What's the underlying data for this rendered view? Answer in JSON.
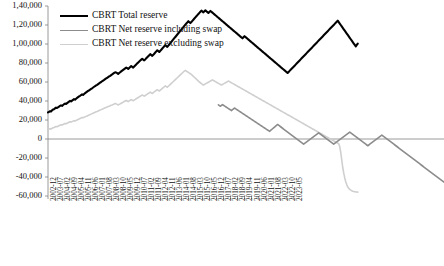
{
  "chart_data": {
    "type": "line",
    "title": "",
    "xlabel": "",
    "ylabel": "",
    "ylim": [
      -60000,
      140000
    ],
    "ytick_values": [
      140000,
      120000,
      100000,
      80000,
      60000,
      40000,
      20000,
      0,
      -20000,
      -40000,
      -60000
    ],
    "ytick_labels": [
      "1,40,000",
      "1,20,000",
      "1,00,000",
      "80,000",
      "60,000",
      "40,000",
      "20,000",
      "0",
      "-20,000",
      "-40,000",
      "-60,000"
    ],
    "grid": false,
    "legend_position": "top-left-inside",
    "x_start": "2002-12",
    "x_end": "2023-05",
    "x_step_months": 1,
    "xtick_step_months": 7,
    "xtick_labels": [
      "2002-12",
      "2003-07",
      "2004-02",
      "2004-09",
      "2005-04",
      "2005-11",
      "2006-06",
      "2007-01",
      "2007-08",
      "2008-03",
      "2008-10",
      "2009-05",
      "2009-12",
      "2010-07",
      "2011-02",
      "2011-09",
      "2012-04",
      "2012-11",
      "2013-06",
      "2014-01",
      "2014-08",
      "2015-03",
      "2015-10",
      "2016-05",
      "2016-12",
      "2017-07",
      "2018-02",
      "2018-09",
      "2019-04",
      "2019-11",
      "2020-06",
      "2021-01",
      "2021-08",
      "2022-03",
      "2022-10",
      "2023-05"
    ],
    "series": [
      {
        "name": "CBRT Total reserve",
        "color": "#000000",
        "width": 2.1,
        "values": [
          28000,
          28600,
          29200,
          28900,
          30100,
          31000,
          31400,
          32200,
          33000,
          32600,
          33400,
          34100,
          34800,
          35400,
          34900,
          35800,
          36600,
          37300,
          36900,
          37800,
          38600,
          39400,
          40100,
          39600,
          40400,
          41200,
          42000,
          41500,
          42400,
          43200,
          44000,
          44800,
          45500,
          46300,
          47000,
          46500,
          47400,
          48200,
          49000,
          49800,
          50600,
          51300,
          52000,
          52700,
          53400,
          54200,
          55000,
          55700,
          56400,
          57000,
          57800,
          58600,
          59300,
          60000,
          60800,
          61500,
          62200,
          63000,
          63700,
          64400,
          65100,
          65800,
          66500,
          67300,
          68000,
          68800,
          69500,
          70200,
          70000,
          69300,
          68500,
          69400,
          70300,
          71200,
          72000,
          72800,
          73600,
          74400,
          75200,
          74500,
          73800,
          74800,
          75800,
          76800,
          76000,
          75200,
          76300,
          77400,
          78500,
          79600,
          80600,
          81600,
          82600,
          83500,
          84400,
          83600,
          82800,
          83800,
          84900,
          86000,
          87100,
          88200,
          89300,
          88400,
          87500,
          88600,
          89800,
          91000,
          92200,
          93400,
          92500,
          91600,
          92800,
          94000,
          95200,
          96400,
          97600,
          98800,
          97900,
          97000,
          98300,
          99600,
          100900,
          102200,
          103500,
          104800,
          106100,
          107400,
          108700,
          110000,
          111300,
          112600,
          113900,
          115200,
          116500,
          117800,
          119100,
          120400,
          121600,
          122800,
          124000,
          123000,
          122000,
          123200,
          124400,
          125600,
          126800,
          128000,
          129200,
          130400,
          131600,
          132800,
          134000,
          135100,
          134200,
          133300,
          134400,
          135400,
          134500,
          133600,
          132700,
          133800,
          134800,
          133900,
          133000,
          132100,
          131200,
          130300,
          129400,
          128500,
          127600,
          126700,
          125800,
          124900,
          124000,
          123100,
          122200,
          121300,
          120400,
          119500,
          118600,
          117700,
          116800,
          115900,
          115000,
          114100,
          113200,
          112300,
          111400,
          110500,
          109600,
          108700,
          107800,
          106900,
          106000,
          107100,
          108200,
          107300,
          106400,
          105500,
          104600,
          103700,
          102800,
          101900,
          101000,
          100100,
          99200,
          98300,
          97400,
          96500,
          95600,
          94700,
          93800,
          92900,
          92000,
          91100,
          90200,
          89300,
          88400,
          87500,
          86600,
          85700,
          84800,
          83900,
          83000,
          82100,
          81200,
          80300,
          79400,
          78500,
          77600,
          76700,
          75800,
          74900,
          74000,
          73100,
          72200,
          71300,
          70400,
          69500,
          70600,
          71700,
          72800,
          73900,
          75000,
          76100,
          77200,
          78300,
          79400,
          80500,
          81600,
          82700,
          83800,
          84900,
          86000,
          87100,
          88200,
          89300,
          90400,
          91500,
          92600,
          93700,
          94800,
          95900,
          97000,
          98100,
          99200,
          100300,
          101400,
          102500,
          103600,
          104700,
          105800,
          106900,
          108000,
          109100,
          110200,
          111300,
          112400,
          113500,
          114600,
          115700,
          116800,
          117900,
          119000,
          120100,
          121200,
          122300,
          123400,
          124500,
          123000,
          121500,
          120000,
          118500,
          117000,
          115500,
          114000,
          112500,
          111000,
          109500,
          108000,
          106500,
          105000,
          103500,
          102000,
          100500,
          99000,
          97500,
          99000,
          100500
        ]
      },
      {
        "name": "CBRT Net reserve including swap",
        "color": "#8c8c8c",
        "width": 1.6,
        "start_index": 170,
        "values": [
          36000,
          35200,
          34500,
          35400,
          36200,
          35500,
          34800,
          34100,
          33400,
          32700,
          32000,
          31300,
          30600,
          29900,
          30800,
          31700,
          32600,
          31900,
          31200,
          30500,
          29800,
          29100,
          28400,
          27700,
          27000,
          26300,
          25600,
          24900,
          24200,
          23500,
          22800,
          22100,
          21400,
          20700,
          20000,
          19300,
          18600,
          17900,
          17200,
          16500,
          15800,
          15100,
          14400,
          13700,
          13000,
          12300,
          11600,
          10900,
          10200,
          9500,
          8800,
          8100,
          9000,
          9900,
          10800,
          11700,
          12600,
          13500,
          14400,
          15300,
          14500,
          13700,
          12900,
          12100,
          11300,
          10500,
          9700,
          8900,
          8100,
          7300,
          6500,
          5700,
          4900,
          4100,
          3300,
          2500,
          1700,
          900,
          100,
          -700,
          -1500,
          -2300,
          -3100,
          -3900,
          -4700,
          -5500,
          -4700,
          -3900,
          -3100,
          -2300,
          -1500,
          -700,
          100,
          900,
          1700,
          2500,
          3300,
          4100,
          4900,
          5700,
          6500,
          5700,
          4900,
          4100,
          3300,
          2500,
          1700,
          900,
          100,
          -700,
          -1500,
          -2300,
          -3100,
          -3900,
          -4700,
          -5500,
          -4700,
          -3900,
          -3100,
          -2300,
          -1500,
          -700,
          100,
          900,
          1700,
          2500,
          3300,
          4100,
          4900,
          5700,
          6500,
          7300,
          6500,
          5700,
          4900,
          4100,
          3300,
          2500,
          1700,
          900,
          100,
          -700,
          -1500,
          -2300,
          -3100,
          -3900,
          -4700,
          -5500,
          -6300,
          -7100,
          -6300,
          -5500,
          -4700,
          -3900,
          -3100,
          -2300,
          -1500,
          -700,
          100,
          900,
          1700,
          2500,
          3300,
          4100,
          3300,
          2500,
          1700,
          900,
          100,
          -700,
          -1500,
          -2300,
          -3100,
          -3900,
          -4700,
          -5500,
          -6300,
          -7100,
          -7900,
          -8700,
          -9500,
          -10300,
          -11100,
          -11900,
          -12700,
          -13500,
          -14300,
          -15100,
          -15900,
          -16700,
          -17500,
          -18300,
          -19100,
          -19900,
          -20700,
          -21500,
          -22300,
          -23100,
          -23900,
          -24700,
          -25500,
          -26300,
          -27100,
          -27900,
          -28700,
          -29500,
          -30300,
          -31100,
          -31900,
          -32700,
          -33500,
          -34300,
          -35100,
          -35900,
          -36700,
          -37500,
          -38300,
          -39100,
          -39900,
          -40700,
          -41500,
          -42300,
          -43100,
          -43900,
          -44700,
          -45500
        ]
      },
      {
        "name": "CBRT Net reserve excluding swap",
        "color": "#cfcfcf",
        "width": 1.6,
        "values": [
          10000,
          10400,
          10900,
          10600,
          11200,
          11800,
          12200,
          12700,
          13200,
          12900,
          13500,
          14000,
          14500,
          15000,
          14700,
          15300,
          15800,
          16300,
          16000,
          16600,
          17100,
          17600,
          18100,
          17800,
          18300,
          18800,
          19300,
          19000,
          19600,
          20100,
          20600,
          21100,
          21600,
          22100,
          22600,
          22300,
          22800,
          23300,
          23800,
          24300,
          24800,
          25300,
          25700,
          26200,
          26700,
          27200,
          27700,
          28100,
          28600,
          29000,
          29500,
          30000,
          30400,
          30900,
          31400,
          31800,
          32300,
          32800,
          33200,
          33700,
          34100,
          34600,
          35000,
          35500,
          35900,
          36400,
          36800,
          37300,
          37000,
          36400,
          35800,
          36400,
          37000,
          37600,
          38200,
          38800,
          39400,
          40000,
          40600,
          40000,
          39400,
          40100,
          40800,
          41500,
          40900,
          40300,
          41000,
          41700,
          42400,
          43100,
          43700,
          44400,
          45000,
          45700,
          46300,
          45700,
          45100,
          45800,
          46500,
          47200,
          47900,
          48600,
          49300,
          48600,
          47900,
          48700,
          49500,
          50300,
          51100,
          51900,
          51200,
          50500,
          51400,
          52300,
          53200,
          54100,
          55000,
          55900,
          55200,
          54500,
          55500,
          56500,
          57500,
          58500,
          59500,
          60500,
          61500,
          62500,
          63500,
          64500,
          65500,
          66500,
          67500,
          68500,
          69500,
          70500,
          71500,
          72200,
          71500,
          70800,
          70100,
          69400,
          68700,
          68000,
          67000,
          66000,
          65000,
          64000,
          63000,
          62000,
          61000,
          60000,
          59200,
          58400,
          57600,
          56800,
          57400,
          58000,
          58600,
          59200,
          59800,
          60400,
          61000,
          61600,
          62200,
          61600,
          61000,
          60400,
          59800,
          59200,
          58600,
          58000,
          57400,
          56800,
          57400,
          58000,
          58600,
          59200,
          59800,
          60400,
          61000,
          60400,
          59800,
          59200,
          58600,
          58000,
          57400,
          56800,
          56200,
          55600,
          55000,
          54400,
          53800,
          53200,
          52600,
          52000,
          51400,
          50800,
          50200,
          49600,
          49000,
          48400,
          47800,
          47200,
          46600,
          46000,
          45400,
          44800,
          44200,
          43600,
          43000,
          42400,
          41800,
          41200,
          40600,
          40000,
          39400,
          38800,
          38200,
          37600,
          37000,
          36400,
          35800,
          35200,
          34600,
          34000,
          33400,
          32800,
          32200,
          31600,
          31000,
          30400,
          29800,
          29200,
          28600,
          28000,
          27400,
          26800,
          26200,
          25600,
          25000,
          24400,
          23800,
          23200,
          22600,
          22000,
          21400,
          20800,
          20200,
          19600,
          19000,
          18400,
          17800,
          17200,
          16600,
          16000,
          15400,
          14800,
          14200,
          13600,
          13000,
          12400,
          11800,
          11200,
          10600,
          10000,
          9400,
          8800,
          8200,
          7600,
          7000,
          6400,
          5800,
          5200,
          4600,
          4000,
          3400,
          2800,
          2200,
          1600,
          1000,
          400,
          -200,
          -800,
          -1400,
          -2000,
          -2600,
          -3200,
          -3800,
          -4400,
          -5000,
          -8000,
          -14000,
          -22000,
          -30000,
          -36000,
          -41000,
          -45000,
          -48000,
          -50500,
          -52000,
          -53000,
          -53800,
          -54400,
          -54900,
          -55200,
          -55500,
          -55700,
          -55800,
          -55900
        ]
      }
    ]
  }
}
